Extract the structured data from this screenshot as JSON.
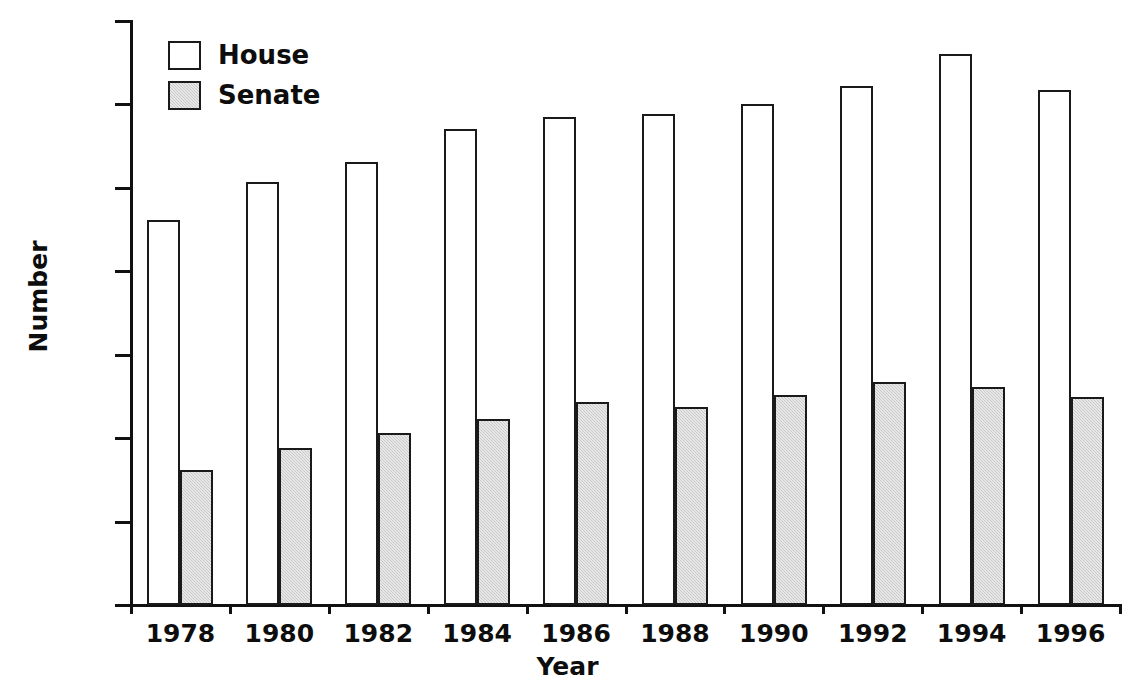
{
  "chart_data": {
    "type": "bar",
    "title": "",
    "xlabel": "Year",
    "ylabel": "Number",
    "categories": [
      "1978",
      "1980",
      "1982",
      "1984",
      "1986",
      "1988",
      "1990",
      "1992",
      "1994",
      "1996"
    ],
    "series": [
      {
        "name": "House",
        "color": "#ffffff",
        "values": [
          2305,
          2535,
          2655,
          2850,
          2925,
          2945,
          3005,
          3110,
          3305,
          3085
        ]
      },
      {
        "name": "Senate",
        "color": "#c9c9c9",
        "values": [
          810,
          940,
          1030,
          1115,
          1215,
          1185,
          1260,
          1335,
          1305,
          1245
        ]
      }
    ],
    "ylim": [
      0,
      3500
    ],
    "y_ticks": [
      0,
      500,
      1000,
      1500,
      2000,
      2500,
      3000,
      3500
    ],
    "y_tick_labels": [
      "0",
      "500",
      "1000",
      "1500",
      "2000",
      "2500",
      "3000",
      "3500"
    ],
    "grid": false,
    "legend_position": "top-left"
  },
  "legend": {
    "items": [
      {
        "label": "House",
        "swatch": "house"
      },
      {
        "label": "Senate",
        "swatch": "senate"
      }
    ]
  },
  "axes": {
    "y_title": "Number",
    "x_title": "Year"
  }
}
